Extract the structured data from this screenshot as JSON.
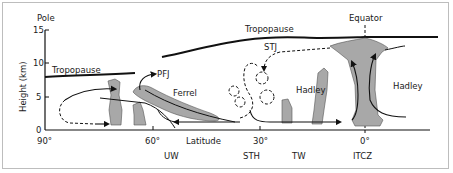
{
  "diagram": {
    "title_pole": "Pole",
    "title_equator": "Equator",
    "y_axis": {
      "label": "Height (km)",
      "ticks": [
        "0",
        "5",
        "10",
        "15"
      ]
    },
    "x_axis": {
      "label": "Latitude",
      "ticks": [
        "90°",
        "60°",
        "30°",
        "0°"
      ]
    },
    "zones": [
      "UW",
      "STH",
      "TW",
      "ITCZ"
    ],
    "labels": {
      "tropopause_left": "Tropopause",
      "tropopause_top": "Tropopause",
      "pfj": "PFJ",
      "stj": "STJ",
      "ferrel": "Ferrel",
      "hadley_left": "Hadley",
      "hadley_right": "Hadley"
    },
    "colors": {
      "cloud_fill": "#a8a8a8",
      "line": "#111111",
      "frame": "#bdbdbd"
    }
  }
}
